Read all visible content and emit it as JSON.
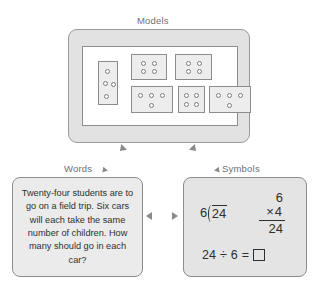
{
  "diagram": {
    "models": {
      "caption": "Models",
      "total_dots": 24,
      "group_count": 6,
      "dots_per_group": 4,
      "cards": [
        {
          "id": "card-1",
          "dot_count": 4,
          "arrangement": "vertical-3-plus-1"
        },
        {
          "id": "card-2",
          "dot_count": 4,
          "arrangement": "2x2"
        },
        {
          "id": "card-3",
          "dot_count": 4,
          "arrangement": "2x2"
        },
        {
          "id": "card-4",
          "dot_count": 4,
          "arrangement": "3-over-1"
        },
        {
          "id": "card-5",
          "dot_count": 4,
          "arrangement": "2x2"
        },
        {
          "id": "card-6",
          "dot_count": 4,
          "arrangement": "3-over-1"
        }
      ]
    },
    "words": {
      "caption": "Words",
      "problem_text": "Twenty-four students are to go on a field trip. Six cars will each take the same number of children. How many should go in each car?"
    },
    "symbols": {
      "caption": "Symbols",
      "long_division": {
        "divisor": "6",
        "dividend": "24"
      },
      "multiplication": {
        "multiplicand": "6",
        "operator": "×",
        "multiplier": "4",
        "product": "24"
      },
      "equation": {
        "dividend": "24",
        "operator": "÷",
        "divisor": "6",
        "equals": "=",
        "answer": ""
      }
    }
  },
  "colors": {
    "frame_fill": "#e2e2e2",
    "panel_fill": "#ffffff",
    "card_fill": "#ededed",
    "border": "#8d8d8d",
    "text": "#2f2f2f",
    "caption": "#6f6f6f",
    "arrow": "#8a8a8a"
  }
}
